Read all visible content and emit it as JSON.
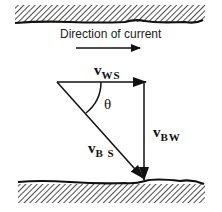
{
  "diagram": {
    "caption": "Direction of current",
    "vectors": {
      "ws": {
        "symbol": "v",
        "subscript": "WS"
      },
      "bw": {
        "symbol": "v",
        "subscript": "BW"
      },
      "bs": {
        "symbol": "v",
        "subscript": "B S"
      }
    },
    "angle_label": "θ",
    "colors": {
      "ink": "#111111",
      "background": "#ffffff"
    }
  }
}
